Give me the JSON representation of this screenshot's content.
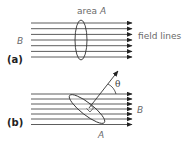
{
  "figure": {
    "panel_a": {
      "tag": "(a)",
      "area_label": "area ",
      "area_symbol": "A",
      "field_symbol": "B",
      "field_lines_label": "field lines",
      "line_count": 7
    },
    "panel_b": {
      "tag": "(b)",
      "angle_symbol": "θ",
      "field_symbol": "B",
      "area_symbol": "A",
      "line_count": 7
    },
    "colors": {
      "line": "#333333",
      "text": "#6a6a6a",
      "background": "#ffffff"
    }
  }
}
